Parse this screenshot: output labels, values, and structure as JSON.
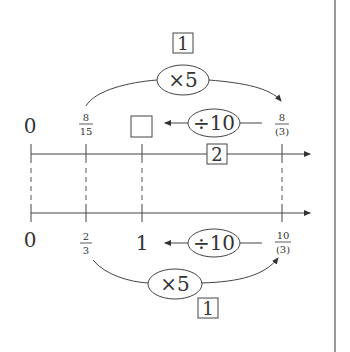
{
  "diagram": {
    "type": "double-number-line",
    "top_line": {
      "labels": [
        "0",
        "8/15",
        "□",
        "8/(3)"
      ],
      "label_0": "0",
      "label_1_num": "8",
      "label_1_den": "15",
      "label_3_num": "8",
      "label_3_den": "(3)",
      "blank_box": "",
      "marker": "2"
    },
    "bottom_line": {
      "labels": [
        "0",
        "2/3",
        "1",
        "10/(3)"
      ],
      "label_0": "0",
      "label_1_num": "2",
      "label_1_den": "3",
      "label_2": "1",
      "label_3_num": "10",
      "label_3_den": "(3)"
    },
    "top_arc": {
      "operation": "×5",
      "marker": "1"
    },
    "top_divide": {
      "operation": "÷10"
    },
    "bottom_arc": {
      "operation": "×5",
      "marker": "1"
    },
    "bottom_divide": {
      "operation": "÷10"
    }
  }
}
